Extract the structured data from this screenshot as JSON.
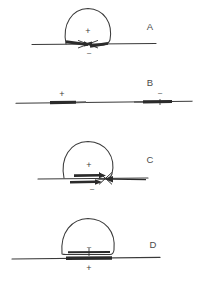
{
  "figure": {
    "background_color": "#ffffff",
    "stroke_color": "#3a3a3a",
    "thick_stroke_color": "#2b2b2b",
    "label_color": "#4a4a4a",
    "width": 201,
    "height": 286,
    "panel_count": 4
  },
  "glyphs": {
    "plus": "+",
    "minus": "–"
  },
  "panels": [
    {
      "id": "panel-a",
      "letter": "A",
      "letter_x": 150,
      "letter_y": 30,
      "baseline": {
        "x1": 32,
        "y": 44,
        "x2": 156
      },
      "loop": {
        "shape": "dome-oval",
        "cx": 88,
        "cy": 26,
        "rx": 24,
        "ry": 18
      },
      "signs": [
        {
          "symbol": "+",
          "x": 88,
          "y": 34,
          "position": "inside-loop"
        },
        {
          "symbol": "–",
          "x": 89,
          "y": 53,
          "position": "below-baseline"
        }
      ],
      "thick_segments": [
        {
          "x1": 66,
          "x2": 86,
          "y": 44
        },
        {
          "x1": 90,
          "x2": 106,
          "y": 44
        }
      ],
      "arrows": [
        {
          "from_x": 66,
          "to_x": 86,
          "y": 42,
          "direction": "right"
        },
        {
          "from_x": 108,
          "to_x": 90,
          "y": 46,
          "direction": "left"
        }
      ],
      "crossing": true
    },
    {
      "id": "panel-b",
      "letter": "B",
      "letter_x": 150,
      "letter_y": 86,
      "baseline": {
        "x1": 16,
        "y": 102,
        "x2": 192
      },
      "loop": null,
      "signs": [
        {
          "symbol": "+",
          "x": 62,
          "y": 96,
          "position": "above-left-segment"
        },
        {
          "symbol": "–",
          "x": 160,
          "y": 94,
          "position": "above-right-segment"
        }
      ],
      "thick_segments": [
        {
          "x1": 50,
          "x2": 76,
          "y": 102
        },
        {
          "x1": 143,
          "x2": 172,
          "y": 102
        }
      ],
      "arrows": [],
      "crossing": false
    },
    {
      "id": "panel-c",
      "letter": "C",
      "letter_x": 150,
      "letter_y": 163,
      "baseline": {
        "x1": 38,
        "y": 178,
        "x2": 148
      },
      "loop": {
        "shape": "dome-oval",
        "cx": 88,
        "cy": 160,
        "rx": 25,
        "ry": 19
      },
      "signs": [
        {
          "symbol": "+",
          "x": 89,
          "y": 167,
          "position": "inside-loop"
        },
        {
          "symbol": "–",
          "x": 92,
          "y": 190,
          "position": "below-bar"
        }
      ],
      "thick_segments": [
        {
          "x1": 76,
          "x2": 104,
          "y": 176
        },
        {
          "x1": 72,
          "x2": 100,
          "y": 182
        }
      ],
      "arrows": [
        {
          "from_x": 74,
          "to_x": 104,
          "y": 176,
          "direction": "right"
        },
        {
          "from_x": 70,
          "to_x": 100,
          "y": 182,
          "direction": "right"
        },
        {
          "from_x": 146,
          "to_x": 106,
          "y": 180,
          "direction": "left"
        }
      ],
      "crossing": true
    },
    {
      "id": "panel-d",
      "letter": "D",
      "letter_x": 153,
      "letter_y": 248,
      "baseline": {
        "x1": 12,
        "y": 258,
        "x2": 160
      },
      "loop": {
        "shape": "dome-rounded",
        "cx": 88,
        "cy": 240,
        "rx": 26,
        "ry": 21
      },
      "signs": [
        {
          "symbol": "–",
          "x": 89,
          "y": 248,
          "position": "above-inner-bar"
        },
        {
          "symbol": "+",
          "x": 89,
          "y": 270,
          "position": "below-baseline-bar"
        }
      ],
      "thick_segments": [
        {
          "x1": 68,
          "x2": 110,
          "y": 252
        },
        {
          "x1": 66,
          "x2": 112,
          "y": 258
        }
      ],
      "arrows": [],
      "crossing": false
    }
  ]
}
